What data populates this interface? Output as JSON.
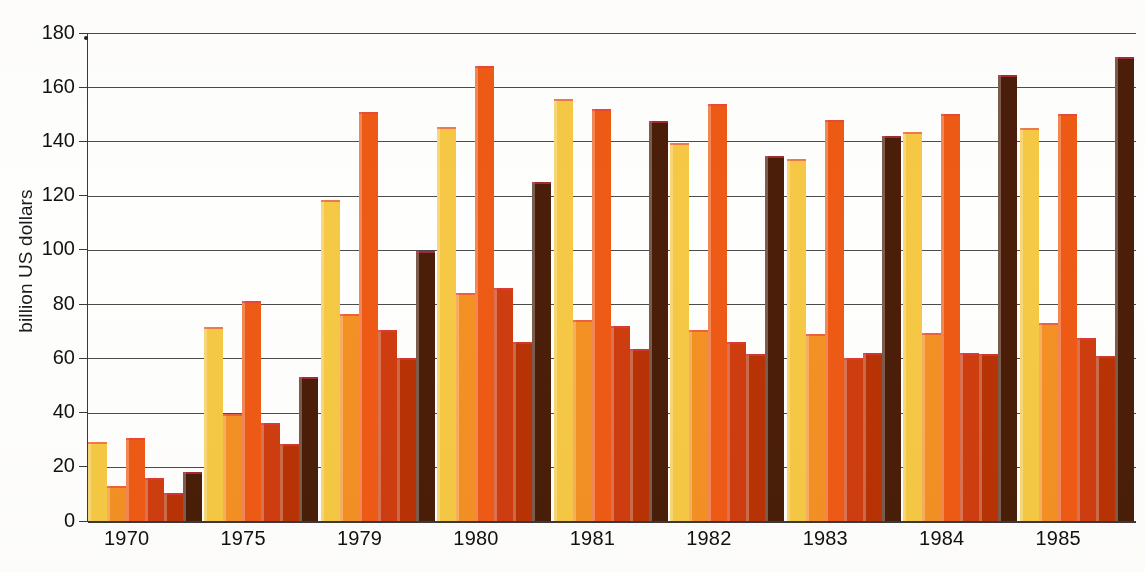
{
  "chart_data": {
    "type": "bar",
    "title": "",
    "xlabel": "",
    "ylabel": "billion US dollars",
    "ylim": [
      0,
      180
    ],
    "ytick_values": [
      180,
      160,
      140,
      120,
      100,
      80,
      60,
      40,
      20,
      0
    ],
    "ytick_labels": [
      "180",
      "160",
      "140",
      "120",
      "100",
      "80",
      "60",
      "40",
      "20",
      "0"
    ],
    "grid": true,
    "legend": "none",
    "categories": [
      "1970",
      "1975",
      "1979",
      "1980",
      "1981",
      "1982",
      "1983",
      "1984",
      "1985"
    ],
    "series": [
      {
        "name": "series-1",
        "color": "#f6c945",
        "values": [
          29,
          71.5,
          118.5,
          145.5,
          155.5,
          139.5,
          133.5,
          143.5,
          145
        ]
      },
      {
        "name": "series-2",
        "color": "#f59124",
        "values": [
          13,
          39.5,
          76.5,
          84,
          74,
          70.5,
          69,
          69.5,
          73
        ]
      },
      {
        "name": "series-3",
        "color": "#ef5b16",
        "values": [
          30.5,
          81,
          151,
          168,
          152,
          154,
          148,
          150,
          150
        ]
      },
      {
        "name": "series-4",
        "color": "#cf3d10",
        "values": [
          16,
          36,
          70.5,
          86,
          72,
          66,
          60,
          62,
          67.5
        ]
      },
      {
        "name": "series-5",
        "color": "#b93305",
        "values": [
          10.5,
          28.5,
          60,
          66,
          63.5,
          61.5,
          62,
          61.5,
          61
        ]
      },
      {
        "name": "series-6",
        "color": "#4a1e09",
        "values": [
          18,
          53,
          99.5,
          125,
          147.5,
          134.5,
          142,
          164.5,
          171
        ]
      }
    ]
  },
  "axis": {
    "y_label_text": "billion US dollars"
  },
  "colors": {
    "yellow": "#f6c945",
    "orange_light": "#f59124",
    "orange": "#ef5b16",
    "red_orange": "#cf3d10",
    "dark_red": "#b93305",
    "dark_brown": "#4a1e09",
    "gridline": "#4c4c4c",
    "background": "#ffffff",
    "text": "#111111"
  }
}
